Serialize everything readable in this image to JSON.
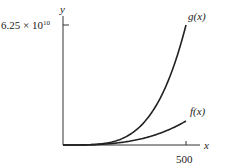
{
  "chart_data": {
    "type": "line",
    "title": "",
    "xlabel": "x",
    "ylabel": "y",
    "xlim": [
      0,
      500
    ],
    "ylim": [
      0,
      62500000000.0
    ],
    "x_ticks": [
      {
        "value": 500,
        "label": "500"
      }
    ],
    "y_ticks": [
      {
        "value": 62500000000.0,
        "label": "6.25 × 10^10"
      }
    ],
    "grid": false,
    "legend": "none (curves labeled directly)",
    "series": [
      {
        "name": "g(x)",
        "formula": "x^4",
        "x": [
          0,
          100,
          200,
          300,
          400,
          500
        ],
        "values": [
          0,
          100000000.0,
          1600000000.0,
          8100000000.0,
          25600000000.0,
          62500000000.0
        ]
      },
      {
        "name": "f(x)",
        "formula": "100x^3",
        "x": [
          0,
          100,
          200,
          300,
          400,
          500
        ],
        "values": [
          0,
          100000000.0,
          800000000.0,
          2700000000.0,
          6400000000.0,
          12500000000.0
        ]
      }
    ],
    "annotations": [
      "g(x)",
      "f(x)"
    ]
  },
  "labels": {
    "y_axis": "y",
    "x_axis": "x",
    "y_tick_base": "6.25 × 10",
    "y_tick_exp": "10",
    "x_tick": "500",
    "g_label": "g(x)",
    "f_label": "f(x)"
  }
}
